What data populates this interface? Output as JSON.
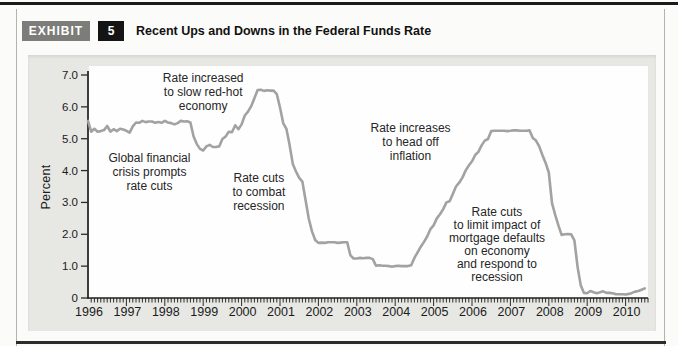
{
  "exhibit": {
    "label": "EXHIBIT",
    "number": "5",
    "title": "Recent Ups and Downs in the Federal Funds Rate"
  },
  "colors": {
    "line": "#a2a2a2",
    "badge_gray": "#7c7c79",
    "badge_black": "#141414",
    "panel_bg": "#e7e7e4",
    "ink": "#1b1b1b"
  },
  "chart_data": {
    "type": "line",
    "title": "Recent Ups and Downs in the Federal Funds Rate",
    "xlabel": "",
    "ylabel": "Percent",
    "xlim": [
      1996,
      2010.58
    ],
    "ylim": [
      0,
      7.3
    ],
    "grid": false,
    "legend": "none",
    "x_tick_labels": [
      "1996",
      "1997",
      "1998",
      "1999",
      "2000",
      "2001",
      "2002",
      "2003",
      "2004",
      "2005",
      "2006",
      "2007",
      "2008",
      "2009",
      "2010"
    ],
    "x_minor_tick_interval_months": 1,
    "y_ticks": [
      0,
      1,
      2,
      3,
      4,
      5,
      6,
      7
    ],
    "y_tick_labels": [
      "0",
      "1.0",
      "2.0",
      "3.0",
      "4.0",
      "5.0",
      "6.0",
      "7.0"
    ],
    "x_start": 1996,
    "x_step_months": 1,
    "series": [
      {
        "name": "Federal funds rate (monthly, percent)",
        "values": [
          5.56,
          5.22,
          5.31,
          5.22,
          5.24,
          5.27,
          5.4,
          5.22,
          5.3,
          5.24,
          5.31,
          5.29,
          5.25,
          5.19,
          5.39,
          5.51,
          5.5,
          5.56,
          5.52,
          5.54,
          5.54,
          5.5,
          5.52,
          5.5,
          5.56,
          5.51,
          5.49,
          5.45,
          5.49,
          5.56,
          5.54,
          5.55,
          5.51,
          5.07,
          4.83,
          4.68,
          4.63,
          4.76,
          4.81,
          4.74,
          4.74,
          4.76,
          4.99,
          5.07,
          5.22,
          5.2,
          5.42,
          5.3,
          5.45,
          5.73,
          5.85,
          6.02,
          6.27,
          6.53,
          6.54,
          6.5,
          6.52,
          6.51,
          6.51,
          6.4,
          5.98,
          5.49,
          5.31,
          4.8,
          4.21,
          3.97,
          3.77,
          3.65,
          3.07,
          2.49,
          2.09,
          1.82,
          1.73,
          1.74,
          1.73,
          1.75,
          1.75,
          1.75,
          1.73,
          1.74,
          1.75,
          1.75,
          1.34,
          1.24,
          1.24,
          1.26,
          1.25,
          1.26,
          1.26,
          1.22,
          1.01,
          1.03,
          1.01,
          1.01,
          1.0,
          0.98,
          1.0,
          1.01,
          1.0,
          1.0,
          1.0,
          1.03,
          1.26,
          1.43,
          1.61,
          1.76,
          1.93,
          2.16,
          2.28,
          2.5,
          2.63,
          2.79,
          3.0,
          3.04,
          3.26,
          3.5,
          3.62,
          3.78,
          4.0,
          4.16,
          4.29,
          4.49,
          4.59,
          4.79,
          4.94,
          4.99,
          5.24,
          5.25,
          5.25,
          5.25,
          5.25,
          5.24,
          5.25,
          5.26,
          5.26,
          5.25,
          5.25,
          5.25,
          5.26,
          5.02,
          4.94,
          4.76,
          4.49,
          4.24,
          3.94,
          2.98,
          2.61,
          2.28,
          1.98,
          2.0,
          2.01,
          2.0,
          1.81,
          0.97,
          0.39,
          0.16,
          0.15,
          0.22,
          0.18,
          0.15,
          0.18,
          0.21,
          0.16,
          0.16,
          0.15,
          0.12,
          0.12,
          0.12,
          0.11,
          0.13,
          0.16,
          0.2,
          0.22,
          0.26,
          0.3
        ]
      }
    ],
    "annotations": [
      {
        "id": "rate-increased-red-hot",
        "lines": [
          "Rate increased",
          "to slow red-hot",
          "economy"
        ],
        "x": 1999.0,
        "y": 6.9,
        "lh": 14
      },
      {
        "id": "global-financial-crisis",
        "lines": [
          "Global financial",
          "crisis prompts",
          "rate cuts"
        ],
        "x": 1997.6,
        "y": 4.4,
        "lh": 14
      },
      {
        "id": "rate-cuts-combat-recession",
        "lines": [
          "Rate cuts",
          "to combat",
          "recession"
        ],
        "x": 2000.45,
        "y": 3.77,
        "lh": 14
      },
      {
        "id": "rate-increases-head-off-inflation",
        "lines": [
          "Rate increases",
          "to head off",
          "inflation"
        ],
        "x": 2004.4,
        "y": 5.35,
        "lh": 14
      },
      {
        "id": "rate-cuts-mortgage-defaults",
        "lines": [
          "Rate cuts",
          "to limit impact of",
          "mortgage defaults",
          "on economy",
          "and respond to",
          "recession"
        ],
        "x": 2006.65,
        "y": 2.7,
        "lh": 13
      }
    ]
  }
}
